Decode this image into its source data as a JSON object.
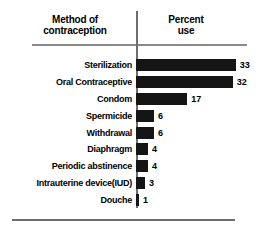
{
  "header": {
    "left_line1": "Method of",
    "left_line2": "contraception",
    "right_line1": "Percent",
    "right_line2": "use"
  },
  "chart_data": {
    "type": "bar",
    "orientation": "horizontal",
    "title": "",
    "xlabel": "Percent use",
    "ylabel": "Method of contraception",
    "categories": [
      "Sterilization",
      "Oral Contraceptive",
      "Condom",
      "Spermicide",
      "Withdrawal",
      "Diaphragm",
      "Periodic abstinence",
      "Intrauterine device(IUD)",
      "Douche"
    ],
    "values": [
      33,
      32,
      17,
      6,
      6,
      4,
      4,
      3,
      1
    ],
    "value_labels": [
      "33",
      "32",
      "17",
      "6",
      "6",
      "4",
      "4",
      "3",
      "1"
    ],
    "xlim": [
      0,
      33
    ],
    "grid": false,
    "legend": null,
    "bar_color": "#151515",
    "axis_color": "#6e6e6e",
    "rule_color": "#8a8a8a",
    "text_color": "#000000"
  },
  "layout": {
    "bar_origin_x": 136,
    "px_per_unit": 3.02,
    "first_row_center_y": 65,
    "row_pitch": 16.88,
    "value_gap": 4
  }
}
